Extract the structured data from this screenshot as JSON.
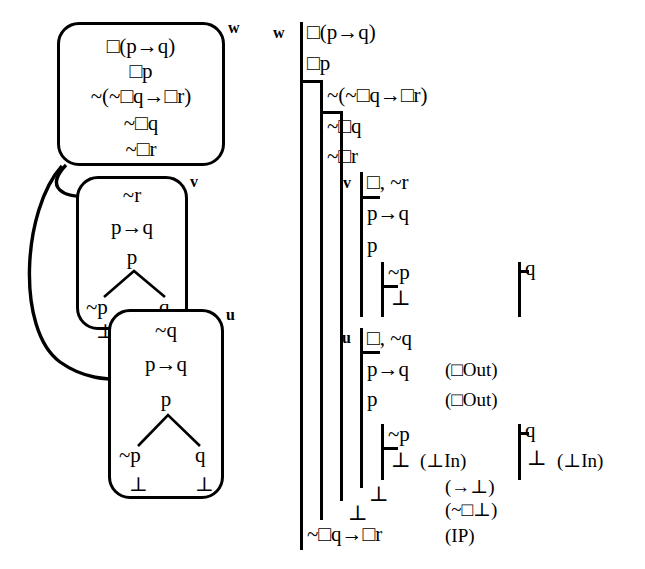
{
  "figure": {
    "type": "modal-logic-countermodel-and-fitch-proof",
    "symbols": {
      "box": "□",
      "neg": "~",
      "arrow": "→",
      "bottom": "⊥"
    }
  },
  "model": {
    "caption": "",
    "worlds": [
      {
        "id": "w",
        "label": "w",
        "formulas": [
          "□(p→q)",
          "□p",
          "~(~□q→□r)",
          "~□q",
          "~□r"
        ]
      },
      {
        "id": "v",
        "label": "v",
        "formulas": [
          "~r",
          "p→q",
          "p"
        ],
        "branch": {
          "left": "~p",
          "right": "q"
        },
        "closures": [
          "⊥"
        ]
      },
      {
        "id": "u",
        "label": "u",
        "formulas": [
          "~q",
          "p→q",
          "p"
        ],
        "branch": {
          "left": "~p",
          "right": "q"
        },
        "closures": [
          "⊥",
          "⊥"
        ]
      }
    ],
    "accessibility": [
      {
        "from": "w",
        "to": "v"
      },
      {
        "from": "w",
        "to": "u"
      }
    ]
  },
  "proof": {
    "outer_world_label": "w",
    "lines": [
      {
        "id": "l1",
        "text": "□(p→q)",
        "justification": ""
      },
      {
        "id": "l2",
        "text": "□p",
        "justification": ""
      },
      {
        "id": "l3",
        "text": "~(~□q→□r)",
        "justification": ""
      },
      {
        "id": "l4",
        "text": "~□q",
        "justification": ""
      },
      {
        "id": "l5",
        "text": "~□r",
        "justification": ""
      },
      {
        "id": "l6",
        "text": "□, ~r",
        "justification": "",
        "world_label": "v"
      },
      {
        "id": "l7",
        "text": "p→q",
        "justification": ""
      },
      {
        "id": "l8",
        "text": "p",
        "justification": ""
      },
      {
        "id": "l9",
        "text": "~p",
        "justification": ""
      },
      {
        "id": "l10",
        "text": "⊥",
        "justification": ""
      },
      {
        "id": "l11",
        "text": "q",
        "justification": ""
      },
      {
        "id": "l12",
        "text": "□, ~q",
        "justification": "",
        "world_label": "u"
      },
      {
        "id": "l13",
        "text": "p→q",
        "justification": "(□Out)"
      },
      {
        "id": "l14",
        "text": "p",
        "justification": "(□Out)"
      },
      {
        "id": "l15",
        "text": "~p",
        "justification": ""
      },
      {
        "id": "l16",
        "text": "⊥",
        "justification": "(⊥In)"
      },
      {
        "id": "l17",
        "text": "q",
        "justification": ""
      },
      {
        "id": "l18",
        "text": "⊥",
        "justification": "(⊥In)"
      },
      {
        "id": "l19",
        "text": "⊥",
        "justification": "(→⊥)"
      },
      {
        "id": "l20",
        "text": "⊥",
        "justification": "(~□⊥)"
      },
      {
        "id": "l21",
        "text": "~□q→□r",
        "justification": "(IP)"
      }
    ]
  }
}
